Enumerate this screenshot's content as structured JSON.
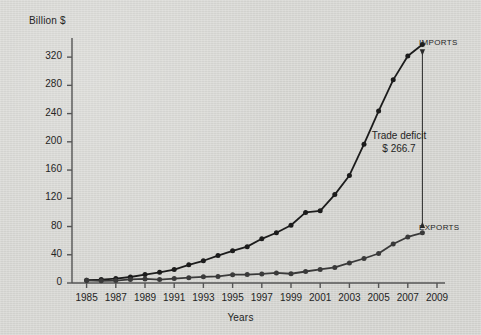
{
  "chart_data": {
    "type": "line",
    "title": "",
    "subtitle": "",
    "xlabel": "Years",
    "ylabel": "Billion $",
    "xlim": [
      1984,
      2009
    ],
    "ylim": [
      0,
      340
    ],
    "yticks": [
      0,
      40,
      80,
      120,
      160,
      200,
      240,
      280,
      320
    ],
    "xticks": [
      1985,
      1987,
      1989,
      1991,
      1993,
      1995,
      1997,
      1999,
      2001,
      2003,
      2005,
      2007,
      2009
    ],
    "grid": false,
    "legend_position": "inline-right-end-of-series",
    "x": [
      1985,
      1986,
      1987,
      1988,
      1989,
      1990,
      1991,
      1992,
      1993,
      1994,
      1995,
      1996,
      1997,
      1998,
      1999,
      2000,
      2001,
      2002,
      2003,
      2004,
      2005,
      2006,
      2007,
      2008
    ],
    "series": [
      {
        "name": "IMPORTS",
        "color": "#1c1c1c",
        "marker": "circle",
        "values": [
          3.9,
          4.8,
          6.3,
          8.5,
          12.0,
          15.2,
          19.0,
          25.7,
          31.5,
          38.8,
          45.6,
          51.5,
          62.6,
          71.2,
          81.8,
          100.0,
          102.3,
          125.2,
          152.4,
          196.7,
          243.5,
          287.8,
          321.5,
          337.8
        ]
      },
      {
        "name": "EXPORTS",
        "color": "#3a3a3a",
        "marker": "circle",
        "values": [
          3.9,
          3.1,
          3.5,
          5.0,
          5.8,
          4.8,
          6.3,
          7.5,
          8.8,
          9.3,
          11.8,
          12.0,
          12.9,
          14.3,
          13.1,
          16.3,
          19.2,
          22.1,
          28.4,
          34.7,
          41.8,
          55.2,
          65.2,
          71.1
        ]
      }
    ],
    "annotations": [
      {
        "name": "trade-deficit",
        "line1": "Trade deficit",
        "line2": "$ 266.7",
        "value": 266.7,
        "at_year": 2008,
        "from_value": 337.8,
        "to_value": 71.1,
        "arrow": "double"
      }
    ]
  },
  "labels": {
    "y_axis_title": "Billion $",
    "x_axis_title": "Years",
    "imports": "IMPORTS",
    "exports": "EXPORTS",
    "deficit_line1": "Trade deficit",
    "deficit_line2": "$ 266.7"
  },
  "ytick_labels": [
    "320",
    "280",
    "240",
    "200",
    "160",
    "120",
    "80",
    "40",
    "0"
  ],
  "xtick_labels": [
    "1985",
    "1987",
    "1989",
    "1991",
    "1993",
    "1995",
    "1997",
    "1999",
    "2001",
    "2003",
    "2005",
    "2007",
    "2009"
  ],
  "colors": {
    "background": "#d6d6d2",
    "axis": "#555555",
    "imports": "#1c1c1c",
    "exports": "#3a3a3a",
    "text": "#242424"
  }
}
